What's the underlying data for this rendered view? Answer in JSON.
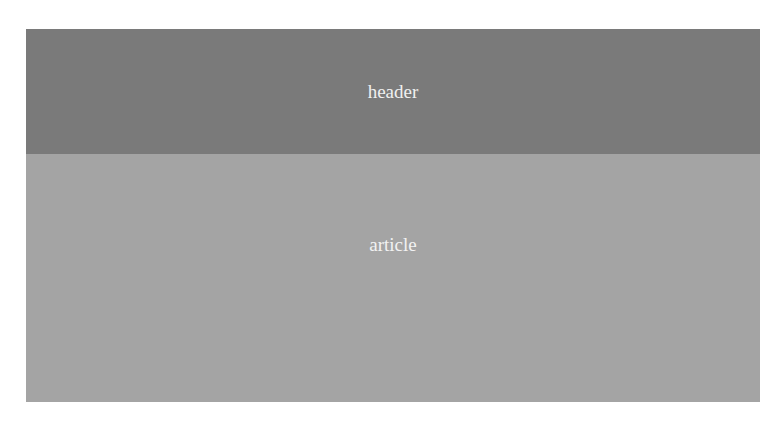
{
  "header": {
    "label": "header",
    "color": "#7a7a7a"
  },
  "article": {
    "label": "article",
    "color": "#a4a4a4"
  }
}
